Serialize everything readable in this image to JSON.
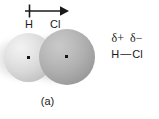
{
  "figure": {
    "background_color": "#ffffff",
    "width": 159,
    "height": 119
  },
  "panel_a": {
    "caption": "(a)",
    "dipole_arrow": {
      "icon": "dipole-moment-arrow-icon",
      "description": "crossed-tail arrow pointing from H toward Cl",
      "direction": "left-to-right",
      "color": "#1a1a1a"
    },
    "atoms": [
      {
        "label": "H",
        "name": "hydrogen",
        "sphere_fill": "#d8d8d8",
        "relative_size": "small"
      },
      {
        "label": "Cl",
        "name": "chlorine",
        "sphere_fill": "#a8a8a8",
        "relative_size": "large"
      }
    ],
    "nucleus_dot_color": "#141414"
  },
  "panel_b": {
    "caption": "(b)",
    "partial_charges": [
      {
        "symbol": "δ+",
        "atom": "H"
      },
      {
        "symbol": "δ−",
        "atom": "Cl"
      }
    ],
    "structure": {
      "left_atom": "H",
      "bond": "—",
      "right_atom": "Cl"
    },
    "text_color": "#1a1a1a"
  }
}
